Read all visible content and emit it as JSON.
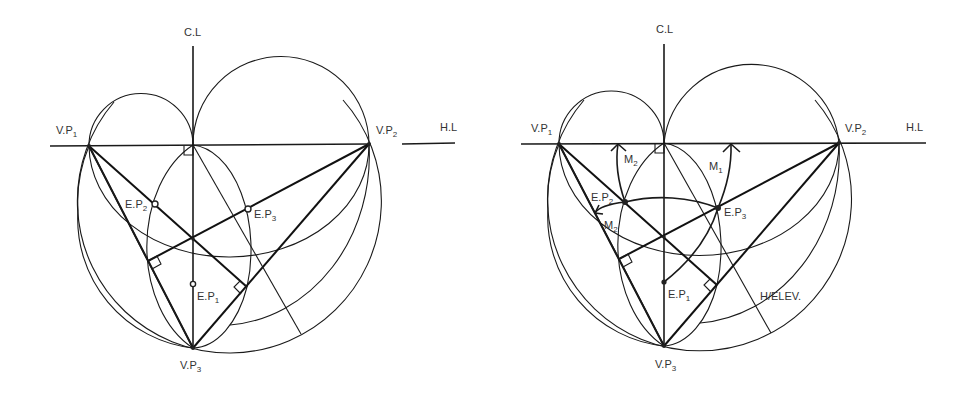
{
  "figures": [
    {
      "id": "left",
      "labels": {
        "center_line": "C.L",
        "horizon_line": "H.L",
        "vp1": {
          "base": "V.P",
          "sub": "1"
        },
        "vp2": {
          "base": "V.P",
          "sub": "2"
        },
        "vp3": {
          "base": "V.P",
          "sub": "3"
        },
        "ep1": {
          "base": "E.P",
          "sub": "1"
        },
        "ep2": {
          "base": "E.P",
          "sub": "2"
        },
        "ep3": {
          "base": "E.P",
          "sub": "3"
        }
      }
    },
    {
      "id": "right",
      "labels": {
        "center_line": "C.L",
        "horizon_line": "H.L",
        "vp1": {
          "base": "V.P",
          "sub": "1"
        },
        "vp2": {
          "base": "V.P",
          "sub": "2"
        },
        "vp3": {
          "base": "V.P",
          "sub": "3"
        },
        "ep1": {
          "base": "E.P",
          "sub": "1"
        },
        "ep2": {
          "base": "E.P",
          "sub": "2"
        },
        "ep3": {
          "base": "E.P",
          "sub": "3"
        },
        "m1": {
          "base": "M",
          "sub": "1"
        },
        "m2_upper": {
          "base": "M",
          "sub": "2"
        },
        "m2_lower": {
          "base": "M",
          "sub": "2"
        },
        "h_elev": "H/ELEV."
      }
    }
  ]
}
